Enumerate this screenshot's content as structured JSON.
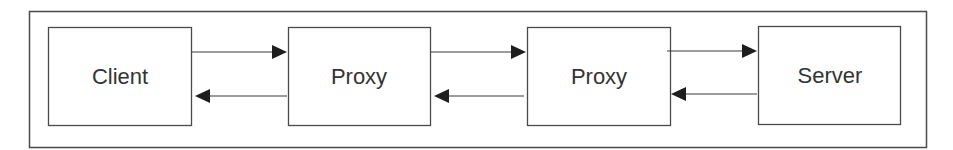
{
  "diagram": {
    "type": "flow",
    "nodes": [
      {
        "id": "client",
        "label": "Client"
      },
      {
        "id": "proxy1",
        "label": "Proxy"
      },
      {
        "id": "proxy2",
        "label": "Proxy"
      },
      {
        "id": "server",
        "label": "Server"
      }
    ],
    "edges": [
      {
        "from": "client",
        "to": "proxy1",
        "direction": "request"
      },
      {
        "from": "proxy1",
        "to": "client",
        "direction": "response"
      },
      {
        "from": "proxy1",
        "to": "proxy2",
        "direction": "request"
      },
      {
        "from": "proxy2",
        "to": "proxy1",
        "direction": "response"
      },
      {
        "from": "proxy2",
        "to": "server",
        "direction": "request"
      },
      {
        "from": "server",
        "to": "proxy2",
        "direction": "response"
      }
    ]
  }
}
